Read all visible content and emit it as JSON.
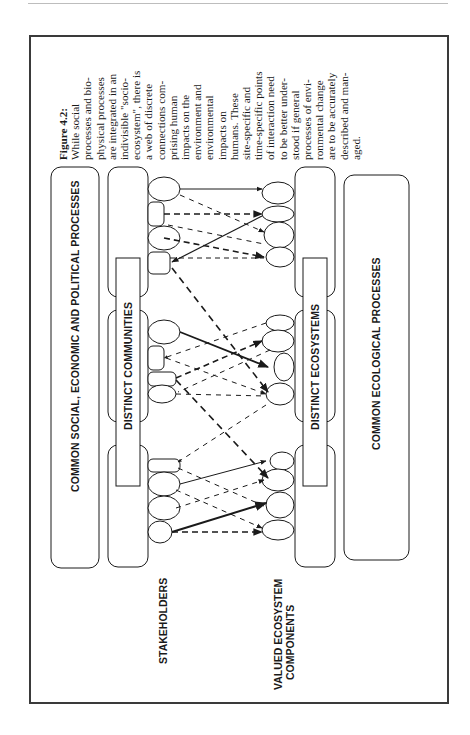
{
  "figure": {
    "number_label": "Figure 4.2:",
    "caption_lines": [
      "While social",
      "processes and bio-",
      "physical processes",
      "are integrated in an",
      "indivisible \"socio-",
      "ecosystem\", there is",
      "a web of discrete",
      "connections com-",
      "prising human",
      "impacts on the",
      "environment and",
      "environmental",
      "impacts on",
      "humans. These",
      "site-specific and",
      "time-specific points",
      "of interaction need",
      "to be better under-",
      "stood if general",
      "processes of envi-",
      "ronmental change",
      "are to be accurately",
      "described and man-",
      "aged."
    ]
  },
  "diagram": {
    "boxes": {
      "common_social": "COMMON SOCIAL, ECONOMIC AND POLITICAL PROCESSES",
      "distinct_communities": "DISTINCT COMMUNITIES",
      "distinct_ecosystems": "DISTINCT ECOSYSTEMS",
      "common_ecological": "COMMON ECOLOGICAL PROCESSES"
    },
    "labels": {
      "stakeholders": "STAKEHOLDERS",
      "valued_line1": "VALUED ECOSYSTEM",
      "valued_line2": "COMPONENTS"
    },
    "groups": 3,
    "link_styles": [
      "solid-thin",
      "solid-thick",
      "dashed-thin",
      "dashed-thick"
    ]
  },
  "colors": {
    "line": "#1a1a1a",
    "frame": "#3a3a3a",
    "rule": "#bdbdbd",
    "background": "#ffffff"
  }
}
